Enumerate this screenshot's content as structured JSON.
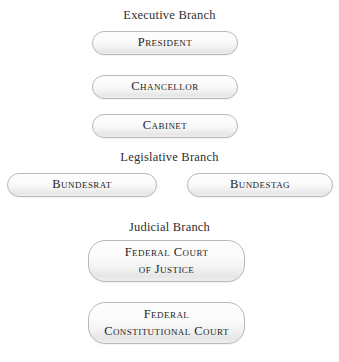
{
  "diagram": {
    "background_color": "#ffffff",
    "node_border_color": "#b9b9b9",
    "node_fill_top_color": "#fdfdfd",
    "node_fill_bottom_color": "#e6e6e6",
    "text_color": "#232323",
    "heading_color": "#2f2f2f"
  },
  "sections": [
    {
      "heading": "Executive Branch",
      "nodes": [
        {
          "label": "President"
        },
        {
          "label": "Chancellor"
        },
        {
          "label": "Cabinet"
        }
      ]
    },
    {
      "heading": "Legislative Branch",
      "nodes": [
        {
          "label": "Bundesrat"
        },
        {
          "label": "Bundestag"
        }
      ]
    },
    {
      "heading": "Judicial Branch",
      "nodes": [
        {
          "label": "Federal Court\nof Justice"
        },
        {
          "label": "Federal\nConstitutional Court"
        }
      ]
    }
  ]
}
